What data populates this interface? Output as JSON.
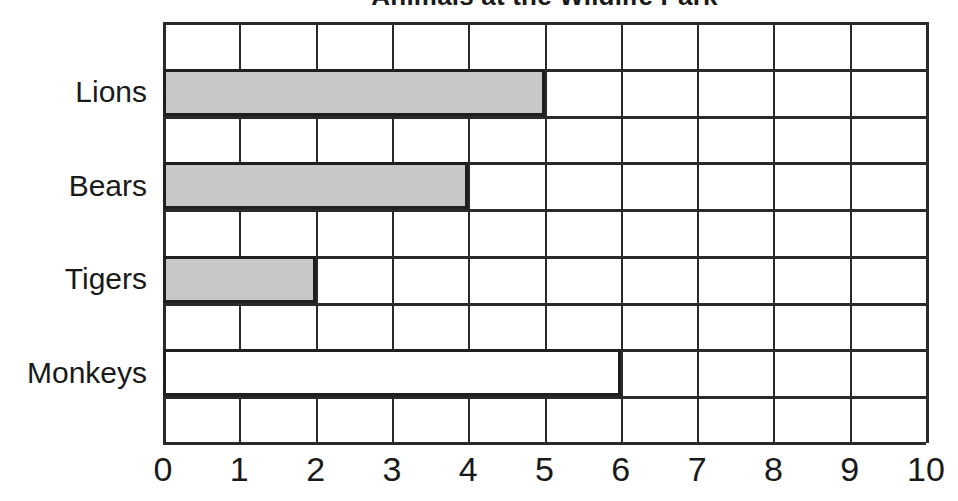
{
  "chart_data": {
    "type": "bar",
    "orientation": "horizontal",
    "title": "Animals at the Wildlife Park",
    "xlabel": "",
    "ylabel": "",
    "categories": [
      "Lions",
      "Bears",
      "Tigers",
      "Monkeys"
    ],
    "values": [
      5,
      4,
      2,
      6
    ],
    "xlim": [
      0,
      10
    ],
    "xticks": [
      "0",
      "1",
      "2",
      "3",
      "4",
      "5",
      "6",
      "7",
      "8",
      "9",
      "10"
    ],
    "grid": true,
    "legend": "none",
    "bar_colors": [
      "#c8c8c8",
      "#c8c8c8",
      "#c8c8c8",
      "#ffffff"
    ],
    "bar_border_color": "#1f1f1f",
    "axis_color": "#2a2a2a",
    "background": "#ffffff"
  }
}
